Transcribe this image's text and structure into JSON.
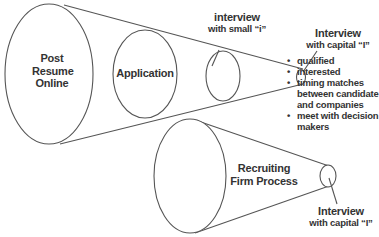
{
  "diagram": {
    "top_funnel": {
      "stages": [
        {
          "label_lines": [
            "Post",
            "Resume",
            "Online"
          ]
        },
        {
          "label_lines": [
            "Application"
          ]
        },
        {
          "label_lines": [
            "interview",
            "with small “i”"
          ]
        },
        {
          "label_lines": [
            "Interview",
            "with capital “I”"
          ]
        }
      ],
      "bullets": [
        "qualified",
        "interested",
        "timing matches between candidate and companies",
        "meet with decision makers"
      ],
      "bullet_lines": [
        [
          "qualified"
        ],
        [
          "interested"
        ],
        [
          "timing matches",
          "between candidate",
          "and companies"
        ],
        [
          "meet with decision",
          "makers"
        ]
      ]
    },
    "bottom_funnel": {
      "label_lines": [
        "Recruiting",
        "Firm Process"
      ],
      "end_label_lines": [
        "Interview",
        "with capital “I”"
      ]
    },
    "colors": {
      "stroke": "#555555",
      "text": "#333333",
      "background": "#ffffff"
    }
  }
}
